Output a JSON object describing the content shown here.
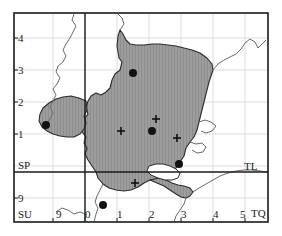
{
  "map": {
    "title": "Grid reference distribution map",
    "frame": {
      "x": 14,
      "y": 13,
      "width": 254,
      "height": 209
    },
    "colors": {
      "land_fill": "#9d9d9d",
      "hatch_line": "#8a8a8a",
      "outline": "#2b2b2b",
      "grid_line": "#d9d9d9",
      "major_line": "#1a1a1a",
      "coast_line": "#5a5a5a",
      "marker_dot": "#111111",
      "marker_cross": "#111111",
      "background": "#ffffff",
      "text": "#1a1a1a"
    },
    "grid": {
      "spacing_px": 32,
      "vertical_lines_x": [
        53,
        85,
        117,
        149,
        181,
        213,
        245
      ],
      "horizontal_lines_y": [
        38,
        70,
        102,
        134,
        166,
        198
      ],
      "major_vertical_x": 85,
      "major_horizontal_y": 172
    },
    "x_axis": {
      "name": "easting",
      "ticks": [
        {
          "label": "9",
          "x": 59,
          "y": 214
        },
        {
          "label": "0",
          "x": 87,
          "y": 214
        },
        {
          "label": "1",
          "x": 118,
          "y": 214
        },
        {
          "label": "2",
          "x": 150,
          "y": 214
        },
        {
          "label": "3",
          "x": 182,
          "y": 214
        },
        {
          "label": "4",
          "x": 214,
          "y": 214
        },
        {
          "label": "5",
          "x": 246,
          "y": 214
        }
      ]
    },
    "y_axis": {
      "name": "northing",
      "ticks": [
        {
          "label": "4",
          "x": 18,
          "y": 33
        },
        {
          "label": "3",
          "x": 18,
          "y": 65
        },
        {
          "label": "2",
          "x": 18,
          "y": 97
        },
        {
          "label": "1",
          "x": 18,
          "y": 129
        },
        {
          "label": "9",
          "x": 18,
          "y": 193
        }
      ]
    },
    "square_labels": [
      {
        "name": "sp",
        "label": "SP",
        "x": 18,
        "y": 161
      },
      {
        "name": "tl",
        "label": "TL",
        "x": 245,
        "y": 162
      },
      {
        "name": "su",
        "label": "SU",
        "x": 18,
        "y": 210
      },
      {
        "name": "tq",
        "label": "TQ",
        "x": 253,
        "y": 209
      }
    ],
    "markers": {
      "dots": [
        {
          "id": "dot-1",
          "x": 133,
          "y": 73
        },
        {
          "id": "dot-2",
          "x": 46,
          "y": 125
        },
        {
          "id": "dot-3",
          "x": 152,
          "y": 131
        },
        {
          "id": "dot-4",
          "x": 179,
          "y": 164
        },
        {
          "id": "dot-5",
          "x": 103,
          "y": 205
        }
      ],
      "crosses": [
        {
          "id": "cross-1",
          "x": 121,
          "y": 131
        },
        {
          "id": "cross-2",
          "x": 156,
          "y": 119
        },
        {
          "id": "cross-3",
          "x": 177,
          "y": 138
        },
        {
          "id": "cross-4",
          "x": 135,
          "y": 183
        }
      ],
      "dot_radius": 4,
      "cross_arm": 4
    },
    "shaded_region": {
      "name": "shaded-distribution-area",
      "description": "Hatched grey polygon covering central study area"
    }
  }
}
